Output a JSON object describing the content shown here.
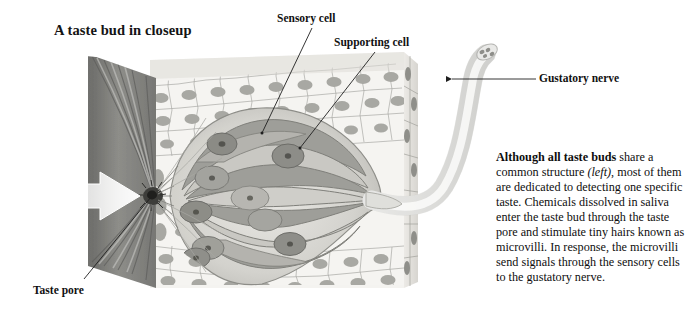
{
  "figure": {
    "title": "A taste bud in closeup",
    "callouts": [
      {
        "id": "sensory-cell",
        "label": "Sensory cell"
      },
      {
        "id": "supporting-cell",
        "label": "Supporting cell"
      },
      {
        "id": "gustatory-nerve",
        "label": "Gustatory nerve"
      },
      {
        "id": "taste-pore",
        "label": "Taste pore"
      }
    ],
    "caption": {
      "lead": "Although all taste buds",
      "part1": " share a common structure ",
      "italic": "(left)",
      "part2": ", most of them are dedicated to detecting one specific taste. Chemicals dissolved in saliva enter the taste bud through the taste pore and stimulate tiny hairs known as microvilli. In response, the microvilli send signals through the sensory cells to the gustatory nerve."
    },
    "colors": {
      "background": "#ffffff",
      "text": "#111111",
      "epithelium_light": "#f2f1ee",
      "epithelium_line": "#9a9a96",
      "nucleus": "#a9a9a5",
      "taste_bud_mid": "#b9b9b4",
      "taste_bud_dark": "#8f8f8a",
      "papilla_dark": "#6e6e6b",
      "nerve": "#ececeb",
      "nerve_line": "#b5b5b2",
      "leader_line": "#2a2a2a"
    }
  }
}
